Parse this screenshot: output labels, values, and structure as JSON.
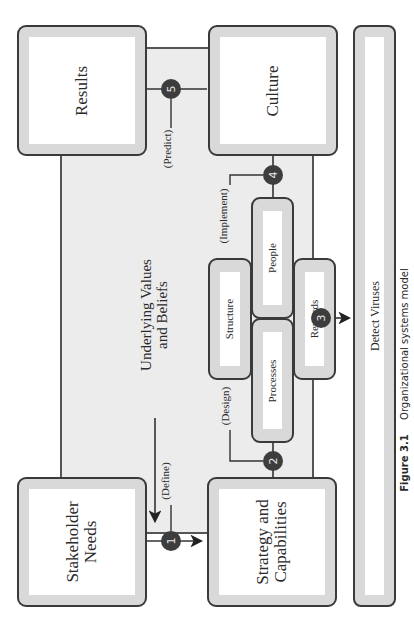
{
  "diagram": {
    "orientation": "rotated 90deg counter-clockwise",
    "background_label": "Underlying Values and Beliefs",
    "background_label_lines": [
      "Underlying Values",
      "and Beliefs"
    ],
    "boxes": {
      "results": "Results",
      "culture": "Culture",
      "stakeholder_lines": [
        "Stakeholder",
        "Needs"
      ],
      "strategy_lines": [
        "Strategy and",
        "Capabilities"
      ],
      "structure": "Structure",
      "people": "People",
      "processes": "Processes",
      "rewards": "Rewards"
    },
    "steps": [
      {
        "number": "1",
        "label": "(Define)"
      },
      {
        "number": "2",
        "label": "(Design)"
      },
      {
        "number": "3",
        "label": ""
      },
      {
        "number": "4",
        "label": "(Implement)"
      },
      {
        "number": "5",
        "label": "(Predict)"
      }
    ],
    "bottom_bar": "Detect Viruses",
    "caption_figure": "Figure 3.1",
    "caption_text": "Organizational systems model",
    "colors": {
      "panel_bg": "#ececec",
      "box_frame": "#d9d9d9",
      "border": "#3a3a3a",
      "badge": "#3d3d3d"
    }
  }
}
